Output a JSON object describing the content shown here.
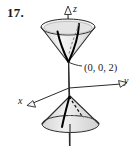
{
  "figure": {
    "problem_number": "17.",
    "axes": {
      "z_label": "z",
      "y_label": "y",
      "x_label": "x"
    },
    "annotations": {
      "apex_point": "(0, 0, 2)"
    },
    "colors": {
      "stroke": "#2b2b2b",
      "curve": "#000000",
      "surface_fill_upper": "#e9e9e9",
      "surface_fill_lower": "#dcdcdc",
      "rim_fill": "#f2f2f2",
      "hidden_line": "#6e6e6e",
      "background": "#ffffff"
    }
  }
}
